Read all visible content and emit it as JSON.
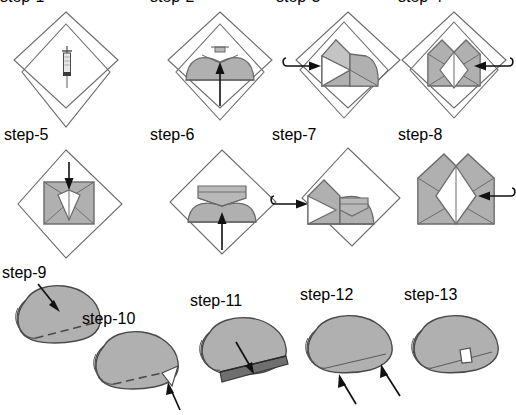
{
  "figure": {
    "caption": "",
    "background_color": "#ffffff",
    "colors": {
      "paper_fill": "#b0b0b0",
      "paper_fill_light": "#c0c0c0",
      "paper_fill_dark": "#6f6f6f",
      "white_fill": "#ffffff",
      "outline": "#6a6a6a",
      "outline_dark": "#4a4a4a",
      "arrow": "#111111",
      "dashed_line": "#555555"
    }
  },
  "rows": [
    {
      "name": "row-1-flat-diamond-steps",
      "panels": [
        {
          "id": "step-1",
          "label": "step-1",
          "shape": "two-overlapping-diamonds",
          "annotation": "syringe-icon",
          "arrow": "none",
          "arrow_label": ""
        },
        {
          "id": "step-2",
          "label": "step-2",
          "shape": "dome-with-notch-on-diamonds",
          "annotation": "cap-icon",
          "arrow": "up",
          "arrow_label": "fold-up"
        },
        {
          "id": "step-3",
          "label": "step-3",
          "shape": "side-folded-on-diamonds",
          "annotation": "",
          "arrow": "curved-right",
          "arrow_label": "fold-right"
        },
        {
          "id": "step-4",
          "label": "step-4",
          "shape": "symmetric-diamond-window",
          "annotation": "",
          "arrow": "curved-left",
          "arrow_label": "fold-left"
        }
      ]
    },
    {
      "name": "row-2-flat-square-steps",
      "panels": [
        {
          "id": "step-5",
          "label": "step-5",
          "shape": "square-with-kite-window",
          "annotation": "",
          "arrow": "down",
          "arrow_label": "press-down"
        },
        {
          "id": "step-6",
          "label": "step-6",
          "shape": "trapezoid-with-top-flap",
          "annotation": "",
          "arrow": "up",
          "arrow_label": "fold-up"
        },
        {
          "id": "step-7",
          "label": "step-7",
          "shape": "side-folded-trapezoid",
          "annotation": "",
          "arrow": "curved-right",
          "arrow_label": "fold-right"
        },
        {
          "id": "step-8",
          "label": "step-8",
          "shape": "pentagon-with-diamond-window",
          "annotation": "",
          "arrow": "curved-left",
          "arrow_label": "fold-left"
        }
      ]
    },
    {
      "name": "row-3-perspective-steps",
      "panels": [
        {
          "id": "step-9",
          "label": "step-9",
          "shape": "rounded-pillow-with-dashed-fold",
          "annotation": "dashed-fold-line",
          "arrow": "diagonal-down-right",
          "arrow_label": "press-here"
        },
        {
          "id": "step-10",
          "label": "step-10",
          "shape": "rounded-pillow-with-corner-tab",
          "annotation": "white-corner-tab",
          "arrow": "diagonal-up-left",
          "arrow_label": "tuck-corner"
        },
        {
          "id": "step-11",
          "label": "step-11",
          "shape": "pillow-with-dark-bottom-flap",
          "annotation": "dark-flap",
          "arrow": "diagonal-down-right",
          "arrow_label": "insert-flap"
        },
        {
          "id": "step-12",
          "label": "step-12",
          "shape": "pillow-with-two-up-arrows",
          "annotation": "",
          "arrow": "two-diagonal-up-left",
          "arrow_label": "push-up"
        },
        {
          "id": "step-13",
          "label": "step-13",
          "shape": "finished-pillow-with-tab",
          "annotation": "white-tab",
          "arrow": "none",
          "arrow_label": ""
        }
      ]
    }
  ]
}
